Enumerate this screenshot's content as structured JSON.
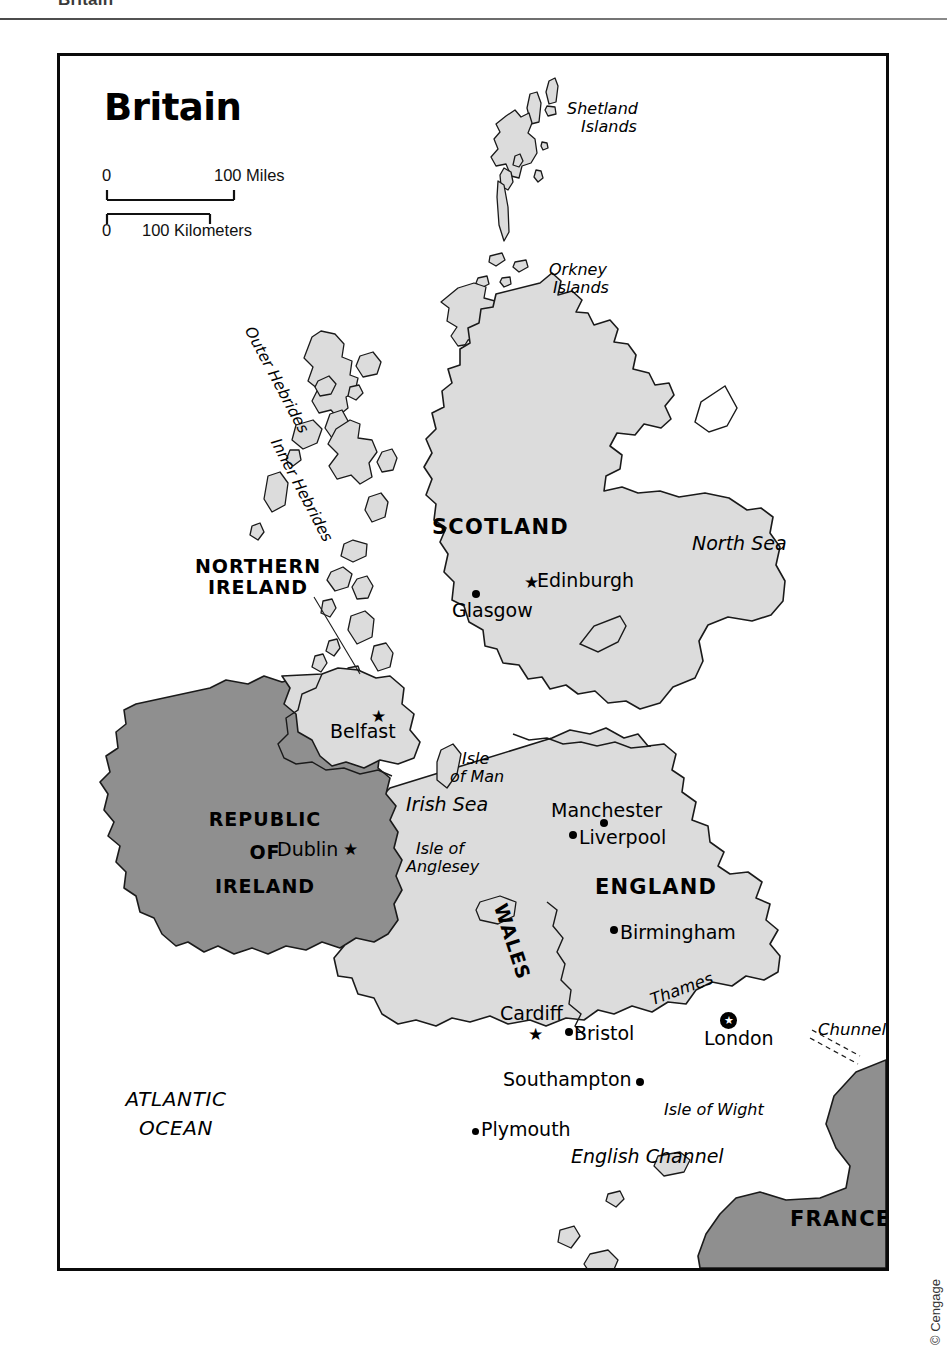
{
  "page": {
    "header_title": "Britain"
  },
  "map": {
    "title": "Britain",
    "scale": {
      "miles_zero": "0",
      "miles_value": "100 Miles",
      "km_zero": "0",
      "km_value": "100 Kilometers"
    },
    "countries": [
      {
        "name": "SCOTLAND"
      },
      {
        "name": "ENGLAND"
      },
      {
        "name": "WALES"
      },
      {
        "name": "NORTHERN IRELAND"
      },
      {
        "name": "REPUBLIC OF IRELAND"
      },
      {
        "name": "FRANCE"
      }
    ],
    "country_labels": {
      "scotland": "SCOTLAND",
      "england": "ENGLAND",
      "wales": "WALES",
      "northern_ireland_line1": "NORTHERN",
      "northern_ireland_line2": "IRELAND",
      "republic_line1": "REPUBLIC",
      "republic_line2": "OF",
      "republic_line3": "IRELAND",
      "france": "FRANCE"
    },
    "cities": [
      {
        "name": "Edinburgh",
        "marker": "star"
      },
      {
        "name": "Glasgow",
        "marker": "dot"
      },
      {
        "name": "Belfast",
        "marker": "star"
      },
      {
        "name": "Dublin",
        "marker": "star"
      },
      {
        "name": "Manchester",
        "marker": "dot"
      },
      {
        "name": "Liverpool",
        "marker": "dot"
      },
      {
        "name": "Birmingham",
        "marker": "dot"
      },
      {
        "name": "Cardiff",
        "marker": "star"
      },
      {
        "name": "Bristol",
        "marker": "dot"
      },
      {
        "name": "London",
        "marker": "capital-star"
      },
      {
        "name": "Southampton",
        "marker": "dot"
      },
      {
        "name": "Plymouth",
        "marker": "dot"
      }
    ],
    "city_labels": {
      "edinburgh": "Edinburgh",
      "glasgow": "Glasgow",
      "belfast": "Belfast",
      "dublin": "Dublin",
      "manchester": "Manchester",
      "liverpool": "Liverpool",
      "birmingham": "Birmingham",
      "cardiff": "Cardiff",
      "bristol": "Bristol",
      "london": "London",
      "southampton": "Southampton",
      "plymouth": "Plymouth"
    },
    "water_labels": {
      "north_sea": "North Sea",
      "irish_sea": "Irish Sea",
      "english_channel": "English Channel",
      "atlantic_line1": "ATLANTIC",
      "atlantic_line2": "OCEAN"
    },
    "island_labels": {
      "shetland_line1": "Shetland",
      "shetland_line2": "Islands",
      "orkney_line1": "Orkney",
      "orkney_line2": "Islands",
      "outer_hebrides": "Outer Hebrides",
      "inner_hebrides": "Inner Hebrides",
      "isle_of_man_line1": "Isle",
      "isle_of_man_line2": "of Man",
      "anglesey_line1": "Isle of",
      "anglesey_line2": "Anglesey",
      "isle_of_wight": "Isle of Wight"
    },
    "feature_labels": {
      "thames": "Thames",
      "chunnel": "Chunnel"
    },
    "colors": {
      "land_light": "#dcdcdc",
      "land_dark": "#8f8f8f",
      "outline": "#1a1a1a",
      "river": "#ffffff",
      "frame": "#0b0b0b",
      "text": "#000000"
    },
    "copyright": "© Cengage"
  }
}
